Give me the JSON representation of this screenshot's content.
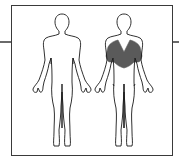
{
  "diagram": {
    "type": "muscle-anatomy-chart",
    "views": [
      {
        "name": "front-view",
        "highlighted": false
      },
      {
        "name": "back-view",
        "highlighted": true,
        "highlight_region": "upper back / latissimus dorsi"
      }
    ],
    "colors": {
      "outline": "#1a1a1a",
      "highlight": "#5a5a5a",
      "frame": "#3a3a3a",
      "background": "#ffffff"
    }
  }
}
